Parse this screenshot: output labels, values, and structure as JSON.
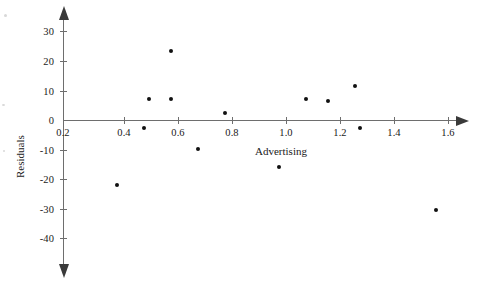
{
  "chart_data": {
    "type": "scatter",
    "title": "",
    "xlabel": "Advertising",
    "ylabel": "Residuals",
    "xlim": [
      0.2,
      1.68
    ],
    "ylim": [
      -45,
      35
    ],
    "grid": false,
    "legend": "none",
    "x_ticks": [
      0.2,
      0.4,
      0.6,
      0.8,
      1.0,
      1.2,
      1.4,
      1.6
    ],
    "x_tick_labels": [
      "0.2",
      "0.4",
      "0.6",
      "0.8",
      "1.0",
      "1.2",
      "1.4",
      "1.6"
    ],
    "y_ticks": [
      30,
      20,
      10,
      0,
      -10,
      -20,
      -30,
      -40
    ],
    "y_tick_labels": [
      "30",
      "20",
      "10",
      "0",
      "-10",
      "-20",
      "-30",
      "-40"
    ],
    "series": [
      {
        "name": "Residuals",
        "marker": "filled-circle",
        "color": "#111111",
        "points": [
          {
            "x": 0.4,
            "y": -22.0
          },
          {
            "x": 0.5,
            "y": -2.7
          },
          {
            "x": 0.52,
            "y": 7.0
          },
          {
            "x": 0.6,
            "y": 23.5
          },
          {
            "x": 0.6,
            "y": 7.0
          },
          {
            "x": 0.7,
            "y": -9.8
          },
          {
            "x": 0.8,
            "y": 2.5
          },
          {
            "x": 1.0,
            "y": -16.0
          },
          {
            "x": 1.1,
            "y": 7.0
          },
          {
            "x": 1.18,
            "y": 6.5
          },
          {
            "x": 1.28,
            "y": 11.5
          },
          {
            "x": 1.3,
            "y": -2.7
          },
          {
            "x": 1.58,
            "y": -30.5
          }
        ]
      }
    ]
  },
  "axes": {
    "x_axis_label": "Advertising",
    "y_axis_label": "Residuals"
  }
}
